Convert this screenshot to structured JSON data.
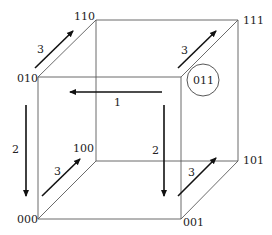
{
  "diagram": {
    "title": "",
    "type": "boolean hypercube (3-cube)",
    "vertices": [
      {
        "id": "000",
        "label": "000"
      },
      {
        "id": "001",
        "label": "001"
      },
      {
        "id": "010",
        "label": "010"
      },
      {
        "id": "011",
        "label": "011",
        "highlighted": true
      },
      {
        "id": "100",
        "label": "100"
      },
      {
        "id": "101",
        "label": "101"
      },
      {
        "id": "110",
        "label": "110"
      },
      {
        "id": "111",
        "label": "111"
      }
    ],
    "arrows": [
      {
        "id": "arrow-1",
        "label": "1",
        "direction": "left"
      },
      {
        "id": "arrow-2-left",
        "label": "2",
        "direction": "down"
      },
      {
        "id": "arrow-2-right",
        "label": "2",
        "direction": "down"
      },
      {
        "id": "arrow-3-top-left",
        "label": "3",
        "direction": "up-right"
      },
      {
        "id": "arrow-3-top-right",
        "label": "3",
        "direction": "up-right"
      },
      {
        "id": "arrow-3-bottom-left",
        "label": "3",
        "direction": "up-right"
      },
      {
        "id": "arrow-3-bottom-right",
        "label": "3",
        "direction": "up-right"
      }
    ],
    "colors": {
      "edge": "#5a5a5a",
      "arrow": "#111111",
      "text": "#222222",
      "background": "#ffffff"
    }
  }
}
